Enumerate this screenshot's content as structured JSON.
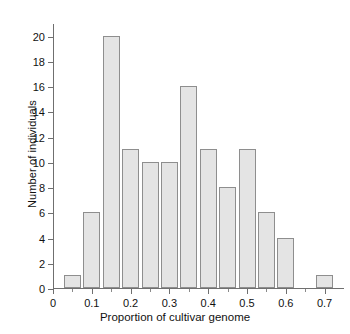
{
  "chart_data": {
    "type": "bar",
    "title": "",
    "xlabel": "Proportion of cultivar genome",
    "ylabel": "Number of individuals",
    "xlim": [
      0,
      0.75
    ],
    "ylim": [
      0,
      21
    ],
    "grid": false,
    "legend": null,
    "bin_width": 0.05,
    "bin_edges": [
      0.025,
      0.075,
      0.125,
      0.175,
      0.225,
      0.275,
      0.325,
      0.375,
      0.425,
      0.475,
      0.525,
      0.575,
      0.625,
      0.675,
      0.725
    ],
    "categories": [
      "0.025-0.075",
      "0.075-0.125",
      "0.125-0.175",
      "0.175-0.225",
      "0.225-0.275",
      "0.275-0.325",
      "0.325-0.375",
      "0.375-0.425",
      "0.425-0.475",
      "0.475-0.525",
      "0.525-0.575",
      "0.575-0.625",
      "0.625-0.675",
      "0.675-0.725"
    ],
    "values": [
      1,
      6,
      20,
      11,
      10,
      10,
      16,
      11,
      8,
      11,
      6,
      4,
      0,
      1
    ],
    "x_ticks": [
      0,
      0.1,
      0.2,
      0.3,
      0.4,
      0.5,
      0.6,
      0.7
    ],
    "x_tick_labels": [
      "0",
      "0.1",
      "0.2",
      "0.3",
      "0.4",
      "0.5",
      "0.6",
      "0.7"
    ],
    "x_minor_ticks": [
      0.05,
      0.15,
      0.25,
      0.35,
      0.45,
      0.55,
      0.65
    ],
    "y_ticks": [
      0,
      2,
      4,
      6,
      8,
      10,
      12,
      14,
      16,
      18,
      20
    ],
    "y_tick_labels": [
      "0",
      "2",
      "4",
      "6",
      "8",
      "10",
      "12",
      "14",
      "16",
      "18",
      "20"
    ],
    "bar_fill_color": "#e4e4e4",
    "bar_edge_color": "#8e8e8e",
    "axis_color": "#6f6f6f"
  }
}
